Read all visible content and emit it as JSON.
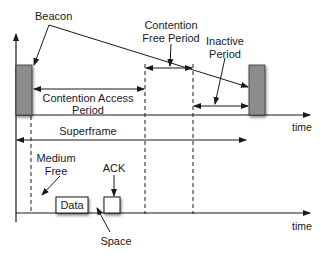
{
  "diagram": {
    "labels": {
      "beacon": "Beacon",
      "contention_free_line1": "Contention",
      "contention_free_line2": "Free Period",
      "inactive_line1": "Inactive",
      "inactive_line2": "Period",
      "cap_line1": "Contention Access",
      "cap_line2": "Period",
      "superframe": "Superframe",
      "time_top": "time",
      "time_bottom": "time",
      "medium_line1": "Medium",
      "medium_line2": "Free",
      "ack": "ACK",
      "data": "Data",
      "space": "Space"
    },
    "colors": {
      "beacon_fill": "#8c8c8c",
      "line": "#1a1a1a",
      "background": "#ffffff"
    }
  }
}
